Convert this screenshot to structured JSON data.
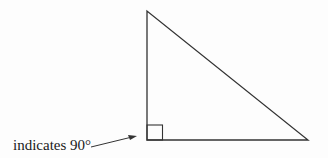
{
  "diagram": {
    "type": "right-triangle",
    "annotation": {
      "text": "indicates 90°",
      "points_to": "right-angle-marker"
    },
    "colors": {
      "stroke": "#333333",
      "text": "#1a1a1a",
      "background": "#fdfdfd"
    }
  }
}
